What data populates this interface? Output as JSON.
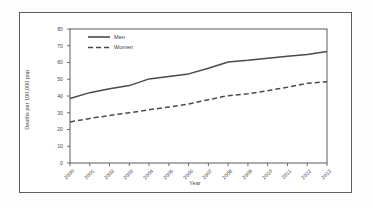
{
  "document": {
    "border_color": "#5d5d5d",
    "background": "#ffffff"
  },
  "chart_data": {
    "type": "line",
    "title": "",
    "subtitle": "",
    "xlabel": "Year",
    "ylabel": "Deaths per 100,000 pop.",
    "x": [
      2000,
      2001,
      2002,
      2003,
      2004,
      2005,
      2006,
      2007,
      2008,
      2009,
      2010,
      2011,
      2012,
      2013
    ],
    "categories": [
      "2000",
      "2001",
      "2002",
      "2003",
      "2004",
      "2005",
      "2006",
      "2007",
      "2008",
      "2009",
      "2010",
      "2011",
      "2012",
      "2013"
    ],
    "xtick_labels": [
      "2000",
      "2001",
      "2002",
      "2003",
      "2004",
      "2005",
      "2006",
      "2007",
      "2008",
      "2009",
      "2010",
      "2011",
      "2012",
      "2013"
    ],
    "ytick_labels": [
      "0",
      "10",
      "20",
      "30",
      "40",
      "50",
      "60",
      "70",
      "80"
    ],
    "ytick_values": [
      0,
      10,
      20,
      30,
      40,
      50,
      60,
      70,
      80
    ],
    "ylim": [
      0,
      80
    ],
    "xlim": [
      2000,
      2013
    ],
    "grid": false,
    "legend_position": "top-left-inside",
    "series": [
      {
        "name": "Men",
        "style": "solid",
        "color": "#4a4a4a",
        "values": [
          38.5,
          42.0,
          44.3,
          46.2,
          50.2,
          51.6,
          53.2,
          56.6,
          60.3,
          61.3,
          62.6,
          63.8,
          64.8,
          66.5
        ]
      },
      {
        "name": "Women",
        "style": "dashed",
        "color": "#4a4a4a",
        "values": [
          24.5,
          26.6,
          28.4,
          30.0,
          31.8,
          33.4,
          35.2,
          37.8,
          40.2,
          41.3,
          43.2,
          45.2,
          47.6,
          48.5
        ]
      }
    ],
    "legend": [
      {
        "label": "Men",
        "style": "solid"
      },
      {
        "label": "Women",
        "style": "dashed"
      }
    ]
  }
}
